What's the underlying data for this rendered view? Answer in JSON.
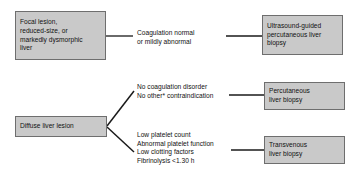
{
  "diagram": {
    "colors": {
      "box_fill": "#c9c9c9",
      "box_border": "#6e6e6e",
      "line": "#1a1a1a",
      "text": "#111111",
      "background": "#ffffff"
    },
    "nodes": {
      "focal_lesion": {
        "lines": [
          "Focal lesion,",
          "reduced-size, or",
          "markedly dysmorphic",
          "liver"
        ]
      },
      "ultrasound_guided": {
        "lines": [
          "Ultrasound-guided",
          "percutaneous liver",
          "biopsy"
        ]
      },
      "diffuse_lesion": {
        "lines": [
          "Diffuse liver lesion"
        ]
      },
      "percutaneous": {
        "lines": [
          "Percutaneous",
          "liver biopsy"
        ]
      },
      "transvenous": {
        "lines": [
          "Transvenous",
          "liver biopsy"
        ]
      }
    },
    "edge_labels": {
      "coagulation_normal": {
        "lines": [
          "Coagulation normal",
          "or mildly abnormal"
        ]
      },
      "no_coagulation_disorder": {
        "lines": [
          "No coagulation disorder",
          "No other* contraindication"
        ]
      },
      "low_platelet": {
        "lines": [
          "Low platelet count",
          "Abnormal platelet function",
          "Low clotting factors",
          "Fibrinolysis <1.30 h"
        ]
      }
    }
  }
}
